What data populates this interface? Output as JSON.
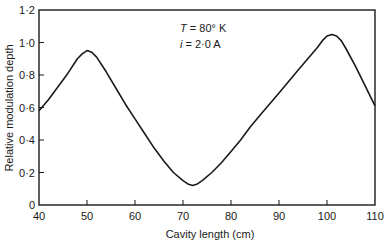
{
  "chart_data": {
    "type": "line",
    "title": "",
    "xlabel": "Cavity length (cm)",
    "ylabel": "Relative modulation depth",
    "xlim": [
      40,
      110
    ],
    "ylim": [
      0,
      1.2
    ],
    "grid": false,
    "legend": null,
    "x_ticks": [
      40,
      50,
      60,
      70,
      80,
      90,
      100,
      110
    ],
    "x_tick_labels": [
      "40",
      "50",
      "60",
      "70",
      "80",
      "90",
      "100",
      "110"
    ],
    "y_ticks": [
      0,
      0.2,
      0.4,
      0.6,
      0.8,
      1.0,
      1.2
    ],
    "y_tick_labels": [
      "0",
      "0·2",
      "0·4",
      "0·6",
      "0·8",
      "1·0",
      "1·2"
    ],
    "annotations": [
      {
        "var": "T",
        "text": " = 80° K"
      },
      {
        "var": "i",
        "text": " = 2·0 A"
      }
    ],
    "series": [
      {
        "name": "Relative modulation depth",
        "x": [
          40,
          42,
          44,
          46,
          48,
          49,
          50,
          51,
          52,
          54,
          56,
          58,
          60,
          62,
          64,
          66,
          68,
          70,
          71,
          72,
          73,
          74,
          76,
          78,
          80,
          82,
          84,
          86,
          88,
          90,
          92,
          94,
          96,
          98,
          99,
          100,
          101,
          102,
          103,
          104,
          106,
          108,
          110
        ],
        "values": [
          0.58,
          0.65,
          0.73,
          0.81,
          0.9,
          0.93,
          0.95,
          0.94,
          0.91,
          0.82,
          0.72,
          0.62,
          0.53,
          0.44,
          0.35,
          0.27,
          0.2,
          0.15,
          0.13,
          0.12,
          0.13,
          0.15,
          0.2,
          0.26,
          0.33,
          0.4,
          0.48,
          0.55,
          0.62,
          0.69,
          0.76,
          0.83,
          0.9,
          0.97,
          1.01,
          1.04,
          1.05,
          1.04,
          1.01,
          0.96,
          0.85,
          0.73,
          0.61
        ]
      }
    ]
  }
}
